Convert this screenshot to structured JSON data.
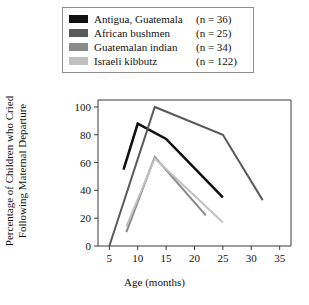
{
  "legend": {
    "items": [
      {
        "label": "Antigua, Guatemala",
        "n": "(n = 36)",
        "color": "#111111",
        "key": "antigua-guatemala"
      },
      {
        "label": "African bushmen",
        "n": "(n = 25)",
        "color": "#5a5a5a",
        "key": "african-bushmen"
      },
      {
        "label": "Guatemalan indian",
        "n": "(n = 34)",
        "color": "#8a8a8a",
        "key": "guatemalan-indian"
      },
      {
        "label": "Israeli kibbutz",
        "n": "(n = 122)",
        "color": "#c0c0c0",
        "key": "israeli-kibbutz"
      }
    ]
  },
  "axes": {
    "y_title": "Percentage of Children who Cried\nFollowing Maternal Departure",
    "x_title": "Age (months)",
    "y_ticks": [
      "0",
      "20",
      "40",
      "60",
      "80",
      "100"
    ],
    "x_ticks": [
      "5",
      "10",
      "15",
      "20",
      "25",
      "30",
      "35"
    ]
  },
  "chart_data": {
    "type": "line",
    "title": "",
    "xlabel": "Age (months)",
    "ylabel": "Percentage of Children who Cried Following Maternal Departure",
    "xlim": [
      3,
      37
    ],
    "ylim": [
      0,
      105
    ],
    "xticks": [
      5,
      10,
      15,
      20,
      25,
      30,
      35
    ],
    "yticks": [
      0,
      20,
      40,
      60,
      80,
      100
    ],
    "grid": false,
    "legend_position": "top",
    "series": [
      {
        "name": "Antigua, Guatemala",
        "n": 36,
        "color": "#111111",
        "x": [
          7.5,
          10,
          15,
          25
        ],
        "y": [
          55,
          88,
          77,
          35
        ]
      },
      {
        "name": "African bushmen",
        "n": 25,
        "color": "#5a5a5a",
        "x": [
          5,
          13,
          25,
          32
        ],
        "y": [
          0,
          100,
          80,
          33
        ]
      },
      {
        "name": "Guatemalan indian",
        "n": 34,
        "color": "#8a8a8a",
        "x": [
          8,
          13,
          22
        ],
        "y": [
          10,
          64,
          22
        ]
      },
      {
        "name": "Israeli kibbutz",
        "n": 122,
        "color": "#c0c0c0",
        "x": [
          8,
          13,
          25
        ],
        "y": [
          14,
          63,
          17
        ]
      }
    ]
  }
}
